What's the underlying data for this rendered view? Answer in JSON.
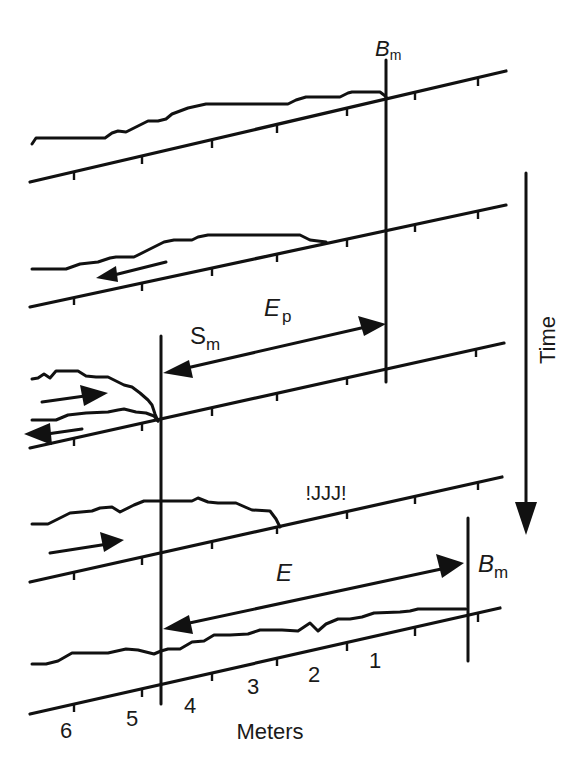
{
  "figure": {
    "stroke_color": "#111111",
    "background": "#ffffff",
    "labels": {
      "bm_top_main": "B",
      "bm_top_sub": "m",
      "ep_main": "E",
      "ep_sub": "p",
      "sm_main": "S",
      "sm_sub": "m",
      "jjj": "!JJJ!",
      "e_main": "E",
      "bm_bottom_main": "B",
      "bm_bottom_sub": "m",
      "time": "Time",
      "axis_title": "Meters"
    },
    "axis_ticks": [
      {
        "label": "6",
        "x": 66,
        "y": 738
      },
      {
        "label": "5",
        "x": 132,
        "y": 726
      },
      {
        "label": "4",
        "x": 209,
        "y": 713
      },
      {
        "label": "3",
        "x": 284,
        "y": 694
      },
      {
        "label": "2",
        "x": 347,
        "y": 682
      },
      {
        "label": "1",
        "x": 415,
        "y": 668
      }
    ]
  }
}
